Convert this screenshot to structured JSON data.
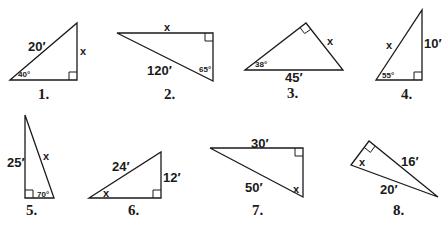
{
  "problems": [
    {
      "number": "1.",
      "labels": {
        "hyp": "20′",
        "opp": "x",
        "angle": "40°"
      },
      "vertices": [
        [
          10,
          80
        ],
        [
          77,
          23
        ],
        [
          77,
          80
        ]
      ],
      "right_angle": [
        77,
        80
      ]
    },
    {
      "number": "2.",
      "labels": {
        "top": "x",
        "hyp": "120′",
        "angle": "65°"
      },
      "vertices": [
        [
          117,
          33
        ],
        [
          213,
          33
        ],
        [
          213,
          81
        ]
      ],
      "right_angle": [
        213,
        33
      ]
    },
    {
      "number": "3.",
      "labels": {
        "side": "x",
        "hyp": "45′",
        "angle": "38°"
      },
      "vertices": [
        [
          245,
          70
        ],
        [
          306,
          23
        ],
        [
          343,
          70
        ]
      ],
      "right_angle": [
        306,
        23
      ]
    },
    {
      "number": "4.",
      "labels": {
        "hyp": "x",
        "opp": "10′",
        "angle": "55°"
      },
      "vertices": [
        [
          376,
          80
        ],
        [
          422,
          10
        ],
        [
          422,
          80
        ]
      ],
      "right_angle": [
        422,
        80
      ]
    },
    {
      "number": "5.",
      "labels": {
        "leg": "25′",
        "hyp": "x",
        "angle": "70°"
      },
      "vertices": [
        [
          25,
          115
        ],
        [
          25,
          198
        ],
        [
          54,
          198
        ]
      ],
      "right_angle": [
        25,
        198
      ]
    },
    {
      "number": "6.",
      "labels": {
        "hyp": "24′",
        "opp": "12′",
        "angle": "x"
      },
      "vertices": [
        [
          89,
          198
        ],
        [
          161,
          152
        ],
        [
          161,
          198
        ]
      ],
      "right_angle": [
        161,
        198
      ]
    },
    {
      "number": "7.",
      "labels": {
        "top": "30′",
        "hyp": "50′",
        "angle": "x"
      },
      "vertices": [
        [
          210,
          148
        ],
        [
          303,
          148
        ],
        [
          303,
          197
        ]
      ],
      "right_angle": [
        303,
        148
      ]
    },
    {
      "number": "8.",
      "labels": {
        "leg": "16′",
        "hyp": "20′",
        "angle": "x"
      },
      "vertices": [
        [
          351,
          165
        ],
        [
          369,
          141
        ],
        [
          438,
          197
        ]
      ],
      "right_angle": [
        369,
        141
      ]
    }
  ],
  "colors": {
    "stroke": "#1a1a1a",
    "background": "#ffffff"
  }
}
